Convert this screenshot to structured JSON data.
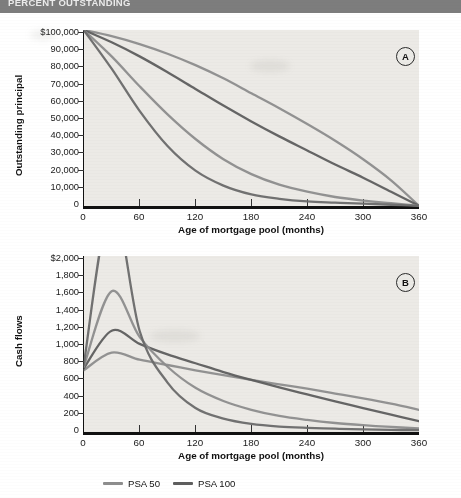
{
  "header": {
    "title": "PERCENT OUTSTANDING"
  },
  "figure": {
    "panels": [
      {
        "tag": "A",
        "ylabel": "Outstanding principal",
        "xlabel": "Age of mortgage pool (months)",
        "yticks": [
          "$100,000",
          "90,000",
          "80,000",
          "70,000",
          "60,000",
          "50,000",
          "40,000",
          "30,000",
          "20,000",
          "10,000",
          "0"
        ],
        "xticks": [
          "0",
          "60",
          "120",
          "180",
          "240",
          "300",
          "360"
        ]
      },
      {
        "tag": "B",
        "ylabel": "Cash flows",
        "xlabel": "Age of mortgage pool (months)",
        "yticks": [
          "$2,000",
          "1,800",
          "1,600",
          "1,400",
          "1,200",
          "1,000",
          "800",
          "600",
          "400",
          "200",
          "0"
        ],
        "xticks": [
          "0",
          "60",
          "120",
          "180",
          "240",
          "300",
          "360"
        ]
      }
    ]
  },
  "legend": {
    "items": [
      {
        "label": "PSA 50",
        "color": "#8d8d8d"
      },
      {
        "label": "PSA 100",
        "color": "#5e5e5e"
      }
    ]
  },
  "chart_data": [
    {
      "type": "line",
      "panel": "A",
      "title": "",
      "xlabel": "Age of mortgage pool (months)",
      "ylabel": "Outstanding principal",
      "xlim": [
        0,
        360
      ],
      "ylim": [
        0,
        100000
      ],
      "xticks": [
        0,
        60,
        120,
        180,
        240,
        300,
        360
      ],
      "yticks": [
        0,
        10000,
        20000,
        30000,
        40000,
        50000,
        60000,
        70000,
        80000,
        90000,
        100000
      ],
      "grid": false,
      "legend_position": "below-figure",
      "x": [
        0,
        30,
        60,
        90,
        120,
        150,
        180,
        210,
        240,
        270,
        300,
        330,
        360
      ],
      "series": [
        {
          "name": "PSA 50",
          "color": "#8d8d8d",
          "values": [
            100000,
            96500,
            92000,
            86500,
            80000,
            72500,
            64000,
            55500,
            46500,
            37000,
            26500,
            14500,
            0
          ]
        },
        {
          "name": "PSA 100",
          "color": "#5e5e5e",
          "values": [
            100000,
            93000,
            85000,
            76000,
            66500,
            57000,
            48000,
            39500,
            31500,
            23500,
            16000,
            8000,
            0
          ]
        },
        {
          "name": "PSA 300",
          "color": "#8d8d8d",
          "values": [
            100000,
            85000,
            68000,
            52000,
            38000,
            26500,
            18000,
            12000,
            8000,
            5000,
            3000,
            1500,
            0
          ]
        },
        {
          "name": "PSA 600",
          "color": "#6a6a6a",
          "values": [
            100000,
            78000,
            54000,
            34000,
            20000,
            11500,
            6500,
            4000,
            2500,
            1800,
            1200,
            600,
            0
          ]
        }
      ]
    },
    {
      "type": "line",
      "panel": "B",
      "title": "",
      "xlabel": "Age of mortgage pool (months)",
      "ylabel": "Cash flows",
      "xlim": [
        0,
        360
      ],
      "ylim": [
        0,
        2000
      ],
      "xticks": [
        0,
        60,
        120,
        180,
        240,
        300,
        360
      ],
      "yticks": [
        0,
        200,
        400,
        600,
        800,
        1000,
        1200,
        1400,
        1600,
        1800,
        2000
      ],
      "grid": false,
      "legend_position": "below-figure",
      "x": [
        0,
        30,
        60,
        90,
        120,
        150,
        180,
        210,
        240,
        270,
        300,
        330,
        360
      ],
      "series": [
        {
          "name": "PSA 50",
          "color": "#8d8d8d",
          "values": [
            700,
            900,
            820,
            760,
            700,
            645,
            590,
            540,
            490,
            435,
            380,
            320,
            250
          ]
        },
        {
          "name": "PSA 100",
          "color": "#5e5e5e",
          "values": [
            720,
            1150,
            1000,
            880,
            780,
            680,
            590,
            505,
            425,
            345,
            270,
            195,
            120
          ]
        },
        {
          "name": "PSA 300",
          "color": "#8d8d8d",
          "values": [
            740,
            1600,
            1080,
            740,
            500,
            350,
            250,
            180,
            135,
            100,
            75,
            55,
            40
          ]
        },
        {
          "name": "PSA 600",
          "color": "#6a6a6a",
          "values": [
            760,
            2600,
            1150,
            560,
            270,
            150,
            90,
            60,
            45,
            35,
            28,
            22,
            18
          ]
        }
      ]
    }
  ]
}
